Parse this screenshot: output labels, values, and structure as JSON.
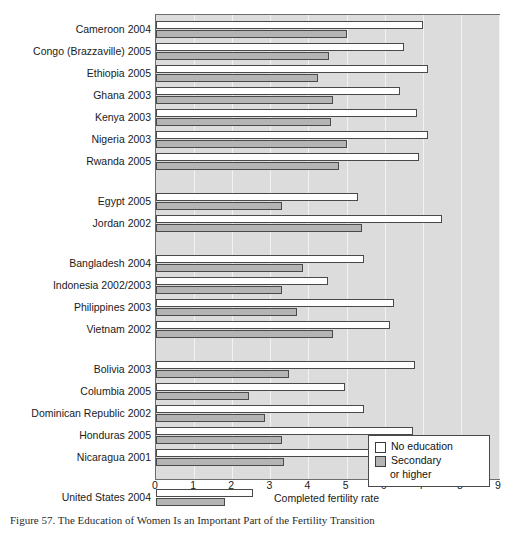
{
  "chart_data": {
    "type": "bar",
    "orientation": "horizontal",
    "title": "",
    "xlabel": "Completed fertility rate",
    "ylabel": "",
    "xlim": [
      0,
      9
    ],
    "xticks": [
      0,
      1,
      2,
      3,
      4,
      5,
      6,
      7,
      8,
      9
    ],
    "grid": true,
    "legend_position": "bottom-right",
    "legend": [
      "No education",
      "Secondary or higher"
    ],
    "series": [
      {
        "name": "No education",
        "color": "#ffffff",
        "values": [
          7.0,
          6.5,
          7.15,
          6.4,
          6.85,
          7.15,
          6.9,
          5.3,
          7.5,
          5.45,
          4.5,
          6.25,
          6.15,
          6.8,
          4.95,
          5.45,
          6.75,
          7.5,
          2.55
        ]
      },
      {
        "name": "Secondary or higher",
        "color": "#b4b4b4",
        "values": [
          5.0,
          4.55,
          4.25,
          4.65,
          4.6,
          5.0,
          4.8,
          3.3,
          5.4,
          3.85,
          3.3,
          3.7,
          4.65,
          3.5,
          2.45,
          2.85,
          3.3,
          3.35,
          1.8
        ]
      }
    ],
    "groups": [
      {
        "name": "sub-saharan-africa",
        "categories": [
          "Cameroon 2004",
          "Congo (Brazzaville) 2005",
          "Ethiopia 2005",
          "Ghana 2003",
          "Kenya 2003",
          "Nigeria 2003",
          "Rwanda 2005"
        ]
      },
      {
        "name": "middle-east",
        "categories": [
          "Egypt 2005",
          "Jordan 2002"
        ]
      },
      {
        "name": "asia",
        "categories": [
          "Bangladesh 2004",
          "Indonesia 2002/2003",
          "Philippines 2003",
          "Vietnam 2002"
        ]
      },
      {
        "name": "latin-america",
        "categories": [
          "Bolivia 2003",
          "Columbia 2005",
          "Dominican Republic 2002",
          "Honduras 2005",
          "Nicaragua 2001"
        ]
      },
      {
        "name": "north-america",
        "categories": [
          "United States 2004"
        ]
      }
    ],
    "categories": [
      "Cameroon 2004",
      "Congo (Brazzaville) 2005",
      "Ethiopia 2005",
      "Ghana 2003",
      "Kenya 2003",
      "Nigeria 2003",
      "Rwanda 2005",
      "Egypt 2005",
      "Jordan 2002",
      "Bangladesh 2004",
      "Indonesia 2002/2003",
      "Philippines 2003",
      "Vietnam 2002",
      "Bolivia 2003",
      "Columbia 2005",
      "Dominican Republic 2002",
      "Honduras 2005",
      "Nicaragua 2001",
      "United States 2004"
    ]
  },
  "legend": {
    "no_education": "No education",
    "secondary": "Secondary",
    "or_higher": "or higher"
  },
  "axis": {
    "xlabel": "Completed fertility rate"
  },
  "caption": {
    "text": "Figure 57. The Education of Women Is an Important Part of the Fertility Transition"
  },
  "colors": {
    "plot_background": "#dcdcdc",
    "gridline": "#f2f2f2",
    "bar_no_education": "#ffffff",
    "bar_secondary": "#b4b4b4",
    "bar_outline": "#4a4a4a",
    "frame": "#6e6e6e"
  }
}
